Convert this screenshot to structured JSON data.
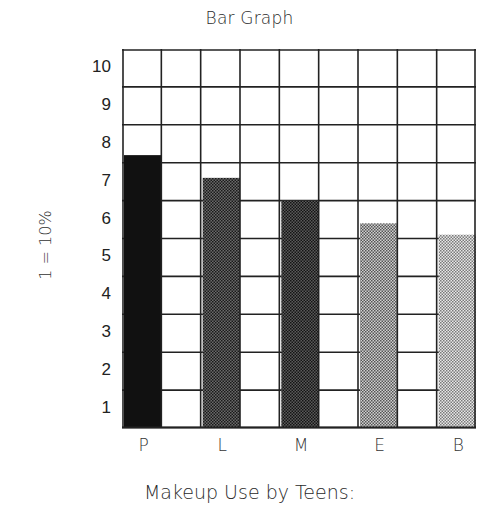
{
  "chart_data": {
    "type": "bar",
    "title": "Bar Graph",
    "caption": "Makeup Use by Teens:",
    "xlabel": "Makeup Use by Teens:",
    "ylabel": "1 = 10%",
    "categories": [
      "P",
      "L",
      "M",
      "E",
      "B"
    ],
    "values": [
      7.2,
      6.6,
      6.0,
      5.4,
      5.1
    ],
    "values_percent": [
      72,
      66,
      60,
      54,
      51
    ],
    "ylim": [
      0,
      10
    ],
    "yticks": [
      "10",
      "9",
      "8",
      "7",
      "6",
      "5",
      "4",
      "3",
      "2",
      "1"
    ],
    "grid": true,
    "grid_columns": 9,
    "grid_rows": 10,
    "bar_fills": [
      "#111111",
      "#4a4a4a",
      "#404040",
      "#9a9a9a",
      "#bdbdbd"
    ]
  }
}
